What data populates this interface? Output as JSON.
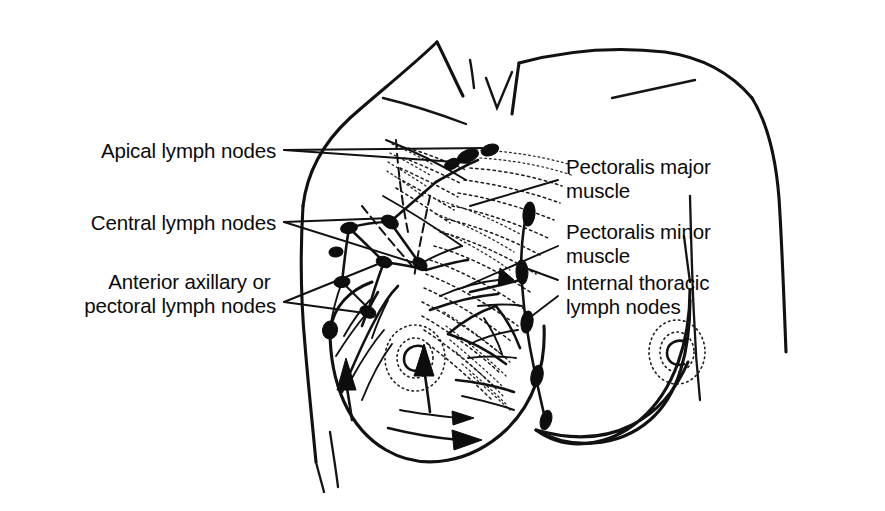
{
  "figure": {
    "style": "black and white line drawing",
    "background_color": "#ffffff",
    "ink_color": "#111111"
  },
  "labels": {
    "apical": {
      "id": "apical-lymph-nodes",
      "line1": "Apical lymph nodes",
      "line2": "",
      "side": "left",
      "x": 276,
      "y": 150
    },
    "central": {
      "id": "central-lymph-nodes",
      "line1": "Central lymph nodes",
      "line2": "",
      "side": "left",
      "x": 276,
      "y": 222
    },
    "anterior_axillary": {
      "id": "anterior-axillary-pectoral-lymph-nodes",
      "line1": "Anterior axillary or",
      "line2": "pectoral lymph nodes",
      "side": "left",
      "x": 276,
      "y": 288
    },
    "pectoralis_major": {
      "id": "pectoralis-major-muscle",
      "line1": "Pectoralis major",
      "line2": "muscle",
      "side": "right",
      "x": 566,
      "y": 168
    },
    "pectoralis_minor": {
      "id": "pectoralis-minor-muscle",
      "line1": "Pectoralis minor",
      "line2": "muscle",
      "side": "right",
      "x": 566,
      "y": 234
    },
    "internal_thoracic": {
      "id": "internal-thoracic-lymph-nodes",
      "line1": "Internal thoracic",
      "line2": "lymph nodes",
      "side": "right",
      "x": 566,
      "y": 285
    }
  },
  "anatomy": {
    "structures": [
      "left shoulder and arm outline",
      "right shoulder and arm outline",
      "neck base with suprasternal notch",
      "clavicle",
      "left breast with stippled areola and nipple",
      "right breast with stippled areola and nipple",
      "pectoralis major muscle fibers",
      "pectoralis minor muscle fibers",
      "axillary lymph node chain",
      "internal thoracic lymph node chain",
      "lymphatic vessels with directional arrows"
    ],
    "node_groups": [
      {
        "name": "apical lymph nodes",
        "count": 3
      },
      {
        "name": "central lymph nodes",
        "count": 4
      },
      {
        "name": "anterior axillary or pectoral lymph nodes",
        "count": 4
      },
      {
        "name": "internal thoracic lymph nodes",
        "count": 5
      }
    ]
  }
}
